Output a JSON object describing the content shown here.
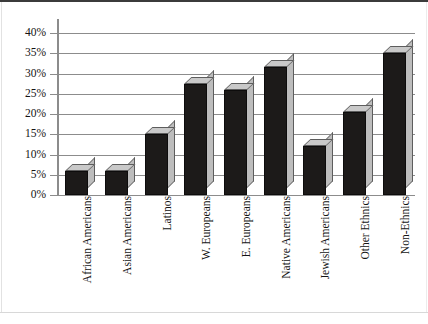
{
  "chart_data": {
    "type": "bar",
    "title": "",
    "subtitle": "",
    "xlabel": "",
    "ylabel": "",
    "categories": [
      "African Americans",
      "Asian Americans",
      "Latinos",
      "W. Europeans",
      "E. Europeans",
      "Native Americans",
      "Jewish Americans",
      "Other Ethnics",
      "Non-Ethnics"
    ],
    "values": [
      6,
      6,
      15,
      27.5,
      26,
      31.5,
      12,
      20.5,
      35
    ],
    "value_labels": [
      "",
      "",
      "",
      "",
      "",
      "",
      "",
      "",
      ""
    ],
    "ytick_labels": [
      "0%",
      "5%",
      "10%",
      "15%",
      "20%",
      "25%",
      "30%",
      "35%",
      "40%"
    ],
    "ytick_values": [
      0,
      5,
      10,
      15,
      20,
      25,
      30,
      35,
      40
    ],
    "ylim": [
      0,
      40
    ],
    "grid": true,
    "legend": false,
    "legend_position": "none",
    "series": [
      {
        "name": "",
        "values": [
          6,
          6,
          15,
          27.5,
          26,
          31.5,
          12,
          20.5,
          35
        ]
      }
    ],
    "colors": {
      "bar_front": "#1c1a19",
      "bar_top": "#c9c9c9",
      "bar_side": "#bdbdbd",
      "gridline": "#8c8c8c",
      "axis": "#8c8c8c",
      "text": "#141414",
      "background": "#ffffff"
    },
    "style": "3d-column"
  }
}
